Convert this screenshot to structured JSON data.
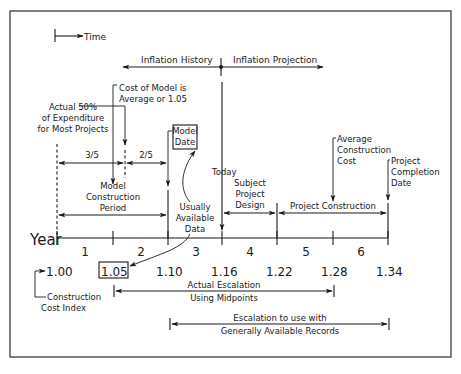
{
  "legend": {
    "time_label": "Time"
  },
  "inflation": {
    "history_label": "Inflation History",
    "projection_label": "Inflation Projection",
    "today_label": "Today"
  },
  "annotations": {
    "actual_50": [
      "Actual 50%",
      "of Expenditure",
      "for Most Projects"
    ],
    "cost_of_model": [
      "Cost of Model is",
      "Average or 1.05"
    ],
    "model_date": [
      "Model",
      "Date"
    ],
    "fraction_3_5": "3/5",
    "fraction_2_5": "2/5",
    "model_construction_period": [
      "Model",
      "Construction",
      "Period"
    ],
    "usually_available_data": [
      "Usually",
      "Available",
      "Data"
    ],
    "subject_project_design": [
      "Subject",
      "Project",
      "Design"
    ],
    "project_construction": "Project Construction",
    "average_construction_cost": [
      "Average",
      "Construction",
      "Cost"
    ],
    "project_completion_date": [
      "Project",
      "Completion",
      "Date"
    ]
  },
  "axis": {
    "label": "Year",
    "years": [
      "1",
      "2",
      "3",
      "4",
      "5",
      "6"
    ]
  },
  "index": {
    "values": [
      "1.00",
      "1.05",
      "1.10",
      "1.16",
      "1.22",
      "1.28",
      "1.34"
    ],
    "boxed": "1.05",
    "label": [
      "Construction",
      "Cost Index"
    ]
  },
  "escalation": {
    "actual": [
      "Actual Escalation",
      "Using Midpoints"
    ],
    "general": [
      "Escalation to use with",
      "Generally Available Records"
    ]
  }
}
